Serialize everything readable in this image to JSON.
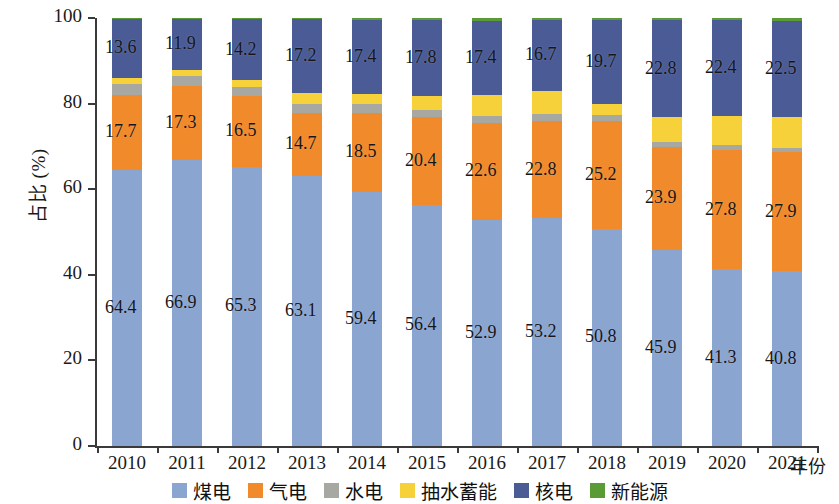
{
  "chart_data": {
    "type": "bar",
    "subtype": "stacked-percentage",
    "title": "",
    "xlabel": "年份",
    "ylabel": "占比 (%)",
    "ylim": [
      0,
      100
    ],
    "yticks": [
      0,
      20,
      40,
      60,
      80,
      100
    ],
    "ytick_labels": [
      "0",
      "20",
      "40",
      "60",
      "80",
      "100"
    ],
    "grid": false,
    "legend_position": "bottom",
    "categories": [
      "2010",
      "2011",
      "2012",
      "2013",
      "2014",
      "2015",
      "2016",
      "2017",
      "2018",
      "2019",
      "2020",
      "2021"
    ],
    "series": [
      {
        "name": "煤电",
        "color": "#8aa5d0",
        "values": [
          64.4,
          66.9,
          65.3,
          63.1,
          59.4,
          56.4,
          52.9,
          53.2,
          50.8,
          45.9,
          41.3,
          40.8
        ],
        "labels": [
          "64.4",
          "66.9",
          "65.3",
          "63.1",
          "59.4",
          "56.4",
          "52.9",
          "53.2",
          "50.8",
          "45.9",
          "41.3",
          "40.8"
        ]
      },
      {
        "name": "气电",
        "color": "#f08a2b",
        "values": [
          17.7,
          17.3,
          16.5,
          14.7,
          18.5,
          20.4,
          22.6,
          22.8,
          25.2,
          23.9,
          27.8,
          27.9
        ],
        "labels": [
          "17.7",
          "17.3",
          "16.5",
          "14.7",
          "18.5",
          "20.4",
          "22.6",
          "22.8",
          "25.2",
          "23.9",
          "27.8",
          "27.9"
        ]
      },
      {
        "name": "水电",
        "color": "#a8a8a2",
        "values": [
          2.4,
          2.3,
          2.1,
          2.0,
          1.9,
          1.7,
          1.6,
          1.5,
          1.4,
          1.3,
          1.2,
          1.0
        ],
        "labels": [
          "",
          "",
          "",
          "",
          "",
          "",
          "",
          "",
          "",
          "",
          "",
          ""
        ]
      },
      {
        "name": "抽水蓄能",
        "color": "#f7d13a",
        "values": [
          1.6,
          1.4,
          1.6,
          2.7,
          2.4,
          3.3,
          4.9,
          5.4,
          2.5,
          5.7,
          6.8,
          7.2
        ],
        "labels": [
          "",
          "",
          "",
          "",
          "",
          "",
          "",
          "",
          "",
          "",
          "",
          ""
        ]
      },
      {
        "name": "核电",
        "color": "#4a5b96",
        "values": [
          13.6,
          11.9,
          14.2,
          17.2,
          17.4,
          17.8,
          17.4,
          16.7,
          19.7,
          22.8,
          22.4,
          22.5
        ],
        "labels": [
          "13.6",
          "11.9",
          "14.2",
          "17.2",
          "17.4",
          "17.8",
          "17.4",
          "16.7",
          "19.7",
          "22.8",
          "22.4",
          "22.5"
        ]
      },
      {
        "name": "新能源",
        "color": "#5b9b35",
        "values": [
          0.3,
          0.2,
          0.3,
          0.3,
          0.4,
          0.4,
          0.6,
          0.4,
          0.4,
          0.4,
          0.5,
          0.6
        ],
        "labels": [
          "",
          "",
          "",
          "",
          "",
          "",
          "",
          "",
          "",
          "",
          "",
          ""
        ]
      }
    ]
  },
  "legend": {
    "items": [
      {
        "label": "煤电",
        "color": "#8aa5d0"
      },
      {
        "label": "气电",
        "color": "#f08a2b"
      },
      {
        "label": "水电",
        "color": "#a8a8a2"
      },
      {
        "label": "抽水蓄能",
        "color": "#f7d13a"
      },
      {
        "label": "核电",
        "color": "#4a5b96"
      },
      {
        "label": "新能源",
        "color": "#5b9b35"
      }
    ]
  },
  "axes": {
    "y_title": "占比 (%)",
    "x_title": "年份"
  }
}
